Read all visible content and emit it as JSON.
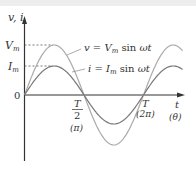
{
  "figure": {
    "y_axis_label": "v, i",
    "x_axis_label": "t",
    "x_axis_label_alt": "(θ)",
    "origin_label": "0",
    "vm_label": "V",
    "vm_sub": "m",
    "im_label": "I",
    "im_sub": "m",
    "half_period_num": "T",
    "half_period_den": "2",
    "half_period_angle": "(π)",
    "period_label": "T",
    "period_angle": "(2π)",
    "v_equation": {
      "lhs": "v",
      "amp": "V",
      "amp_sub": "m",
      "func": "sin",
      "arg": "ωt"
    },
    "i_equation": {
      "lhs": "i",
      "amp": "I",
      "amp_sub": "m",
      "func": "sin",
      "arg": "ωt"
    }
  },
  "colors": {
    "axis": "#333333",
    "v_curve": "#aaaaaa",
    "i_curve": "#777777",
    "dashed": "#555555"
  },
  "chart_data": {
    "type": "line",
    "title": "",
    "xlabel": "t (θ)",
    "ylabel": "v, i",
    "x_ticks": [
      "0",
      "T/2 (π)",
      "T (2π)"
    ],
    "y_ticks": [
      "I_m",
      "V_m"
    ],
    "series": [
      {
        "name": "v = V_m sin ωt",
        "amplitude": 1.0,
        "function": "sin",
        "x_range_periods": [
          0,
          1.33
        ]
      },
      {
        "name": "i = I_m sin ωt",
        "amplitude": 0.58,
        "function": "sin",
        "x_range_periods": [
          0,
          1.33
        ]
      }
    ],
    "grid": false,
    "legend": "inline annotations"
  }
}
